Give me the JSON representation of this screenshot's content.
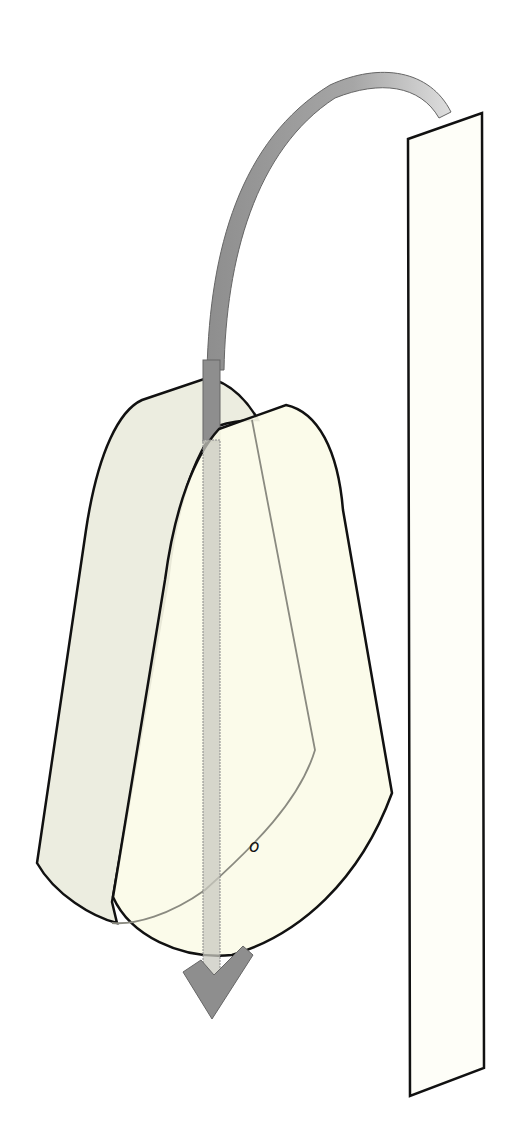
{
  "diagram": {
    "type": "illustration",
    "label": "o",
    "colors": {
      "background": "#ffffff",
      "panel_fill": "#fefef8",
      "back_flap_fill": "#ecede0",
      "front_flap_fill": "#fbfbe8",
      "arrow_dark": "#8c8c8c",
      "arrow_light": "#d8d8d8",
      "stroke": "#111111"
    }
  }
}
